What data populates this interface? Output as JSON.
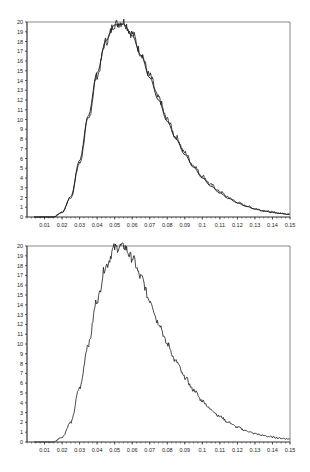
{
  "chart_data": [
    {
      "type": "line",
      "title": "",
      "xlabel": "",
      "ylabel": "",
      "xlim": [
        0,
        0.15
      ],
      "ylim": [
        0,
        20
      ],
      "grid": false,
      "legend": null,
      "x_ticks": [
        "0.01",
        "0.02",
        "0.03",
        "0.04",
        "0.05",
        "0.06",
        "0.07",
        "0.08",
        "0.09",
        "0.1",
        "0.11",
        "0.12",
        "0.13",
        "0.14",
        "0.15"
      ],
      "y_ticks": [
        "0",
        "1",
        "2",
        "3",
        "4",
        "5",
        "6",
        "7",
        "8",
        "9",
        "10",
        "11",
        "12",
        "13",
        "14",
        "15",
        "16",
        "17",
        "18",
        "19",
        "20"
      ],
      "series": [
        {
          "name": "empirical (noisy)",
          "style": "jagged",
          "x": [
            0.015,
            0.02,
            0.025,
            0.03,
            0.035,
            0.04,
            0.045,
            0.05,
            0.055,
            0.06,
            0.065,
            0.07,
            0.075,
            0.08,
            0.085,
            0.09,
            0.095,
            0.1,
            0.105,
            0.11,
            0.115,
            0.12,
            0.125,
            0.13,
            0.135,
            0.14,
            0.145,
            0.15
          ],
          "values": [
            0,
            0.5,
            2,
            5.5,
            10,
            14.5,
            18,
            19.8,
            20,
            18.8,
            16.8,
            14.5,
            12.2,
            10,
            8.2,
            6.6,
            5.3,
            4.2,
            3.3,
            2.6,
            2.0,
            1.5,
            1.15,
            0.85,
            0.65,
            0.5,
            0.38,
            0.3
          ]
        },
        {
          "name": "fitted (smooth)",
          "style": "smooth",
          "x": [
            0.015,
            0.02,
            0.025,
            0.03,
            0.035,
            0.04,
            0.045,
            0.05,
            0.055,
            0.06,
            0.065,
            0.07,
            0.075,
            0.08,
            0.085,
            0.09,
            0.095,
            0.1,
            0.105,
            0.11,
            0.115,
            0.12,
            0.125,
            0.13,
            0.135,
            0.14,
            0.145,
            0.15
          ],
          "values": [
            0,
            0.45,
            2.1,
            5.8,
            10.4,
            14.8,
            18.1,
            19.7,
            19.8,
            18.6,
            16.6,
            14.3,
            12.0,
            9.8,
            8.0,
            6.4,
            5.1,
            4.0,
            3.15,
            2.45,
            1.9,
            1.45,
            1.1,
            0.82,
            0.62,
            0.46,
            0.35,
            0.26
          ]
        }
      ]
    },
    {
      "type": "line",
      "title": "",
      "xlabel": "",
      "ylabel": "",
      "xlim": [
        0,
        0.15
      ],
      "ylim": [
        0,
        20
      ],
      "grid": false,
      "legend": null,
      "x_ticks": [
        "0.01",
        "0.02",
        "0.03",
        "0.04",
        "0.05",
        "0.06",
        "0.07",
        "0.08",
        "0.09",
        "0.1",
        "0.11",
        "0.12",
        "0.13",
        "0.14",
        "0.15"
      ],
      "y_ticks": [
        "0",
        "1",
        "2",
        "3",
        "4",
        "5",
        "6",
        "7",
        "8",
        "9",
        "10",
        "11",
        "12",
        "13",
        "14",
        "15",
        "16",
        "17",
        "18",
        "19",
        "20"
      ],
      "series": [
        {
          "name": "empirical (noisy)",
          "style": "jagged",
          "x": [
            0.015,
            0.02,
            0.025,
            0.03,
            0.035,
            0.04,
            0.045,
            0.05,
            0.055,
            0.06,
            0.065,
            0.07,
            0.075,
            0.08,
            0.085,
            0.09,
            0.095,
            0.1,
            0.105,
            0.11,
            0.115,
            0.12,
            0.125,
            0.13,
            0.135,
            0.14,
            0.145,
            0.15
          ],
          "values": [
            0,
            0.5,
            2,
            5.5,
            10,
            14.5,
            18,
            19.8,
            20,
            18.8,
            16.8,
            14.5,
            12.2,
            10,
            8.2,
            6.6,
            5.3,
            4.2,
            3.3,
            2.6,
            2.0,
            1.5,
            1.15,
            0.85,
            0.65,
            0.5,
            0.38,
            0.3
          ]
        }
      ]
    }
  ],
  "style": {
    "line_color": "#1a1a1a",
    "axis_color": "#333333",
    "frame_color": "#888888"
  }
}
